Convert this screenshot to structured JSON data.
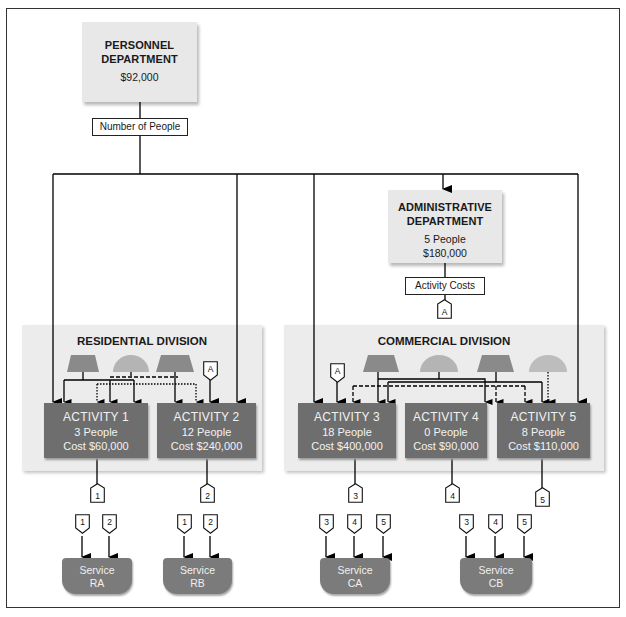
{
  "personnel": {
    "title_line1": "PERSONNEL",
    "title_line2": "DEPARTMENT",
    "cost": "$92,000",
    "driver_label": "Number of People"
  },
  "admin": {
    "title_line1": "ADMINISTRATIVE",
    "title_line2": "DEPARTMENT",
    "people": "5 People",
    "cost": "$180,000",
    "driver_label": "Activity Costs",
    "tag": "A"
  },
  "residential": {
    "title": "RESIDENTIAL DIVISION",
    "activities": [
      {
        "name": "ACTIVITY 1",
        "people": "3 People",
        "cost": "Cost $60,000",
        "tag": "1"
      },
      {
        "name": "ACTIVITY 2",
        "people": "12 People",
        "cost": "Cost $240,000",
        "tag": "2"
      }
    ],
    "admin_tag": "A"
  },
  "commercial": {
    "title": "COMMERCIAL DIVISION",
    "activities": [
      {
        "name": "ACTIVITY 3",
        "people": "18 People",
        "cost": "Cost $400,000",
        "tag": "3"
      },
      {
        "name": "ACTIVITY 4",
        "people": "0 People",
        "cost": "Cost $90,000",
        "tag": "4"
      },
      {
        "name": "ACTIVITY 5",
        "people": "8 People",
        "cost": "Cost $110,000",
        "tag": "5"
      }
    ],
    "admin_tag": "A"
  },
  "services": [
    {
      "line1": "Service",
      "line2": "RA",
      "inputs": [
        "1",
        "2"
      ]
    },
    {
      "line1": "Service",
      "line2": "RB",
      "inputs": [
        "1",
        "2"
      ]
    },
    {
      "line1": "Service",
      "line2": "CA",
      "inputs": [
        "3",
        "4",
        "5"
      ]
    },
    {
      "line1": "Service",
      "line2": "CB",
      "inputs": [
        "3",
        "4",
        "5"
      ]
    }
  ],
  "colors": {
    "activity_fill": "#6e6e6e",
    "service_fill": "#7b7b7b",
    "panel_fill": "#ececec",
    "dept_fill": "#e8e8e8",
    "shape_dark": "#8a8a8a",
    "shape_light": "#b4b4b4"
  }
}
